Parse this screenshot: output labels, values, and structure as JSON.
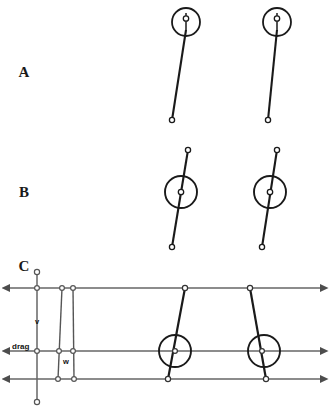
{
  "figure": {
    "title": "",
    "width": 329,
    "height": 420,
    "background": "#ffffff",
    "stroke_dark": "#1a1a1a",
    "stroke_grey": "#666666",
    "node_fill": "#ffffff"
  },
  "panels": [
    {
      "letter": "A",
      "letter_x": 24,
      "letter_y": 77,
      "description": "two tilted rods with circle at top end",
      "rods": [
        {
          "name": "rod-a-left",
          "top": {
            "x": 186,
            "y": 30
          },
          "bottom": {
            "x": 172,
            "y": 120
          },
          "circle": {
            "cx": 186,
            "cy": 22,
            "r": 14
          },
          "inner_node": {
            "cx": 186,
            "cy": 19,
            "r": 2.6
          },
          "inner_tick": {
            "x1": 186,
            "y1": 14,
            "x2": 186,
            "y2": 30
          }
        },
        {
          "name": "rod-a-right",
          "top": {
            "x": 277,
            "y": 30
          },
          "bottom": {
            "x": 268,
            "y": 120
          },
          "circle": {
            "cx": 277,
            "cy": 22,
            "r": 14
          },
          "inner_node": {
            "cx": 277,
            "cy": 19,
            "r": 2.6
          },
          "inner_tick": {
            "x1": 277,
            "y1": 14,
            "x2": 277,
            "y2": 30
          }
        }
      ]
    },
    {
      "letter": "B",
      "letter_x": 24,
      "letter_y": 197,
      "description": "two tilted rods with circle at midpoint",
      "rods": [
        {
          "name": "rod-b-left",
          "top": {
            "x": 188,
            "y": 150
          },
          "bottom": {
            "x": 172,
            "y": 247
          },
          "circle": {
            "cx": 181,
            "cy": 192,
            "r": 16
          },
          "inner_node": {
            "cx": 181,
            "cy": 192,
            "r": 2.6
          }
        },
        {
          "name": "rod-b-right",
          "top": {
            "x": 277,
            "y": 150
          },
          "bottom": {
            "x": 262,
            "y": 247
          },
          "circle": {
            "cx": 270,
            "cy": 192,
            "r": 16
          },
          "inner_node": {
            "cx": 270,
            "cy": 192,
            "r": 2.6
          }
        }
      ]
    },
    {
      "letter": "C",
      "letter_x": 24,
      "letter_y": 271,
      "description": "kinematic diagram with three horizontal double arrows, vertical v axis, drag label, narrow parallelogram of width w, and two tilted rods with circles",
      "labels": {
        "velocity": "v",
        "velocity_x": 37,
        "velocity_y": 324,
        "drag": "drag",
        "drag_x": 12,
        "drag_y": 349,
        "width": "w",
        "width_x": 66,
        "width_y": 363
      },
      "arrows": [
        {
          "name": "arrow-top",
          "y": 288,
          "x1": 10,
          "x2": 320
        },
        {
          "name": "arrow-middle",
          "y": 351,
          "x1": 10,
          "x2": 320
        },
        {
          "name": "arrow-bottom",
          "y": 379,
          "x1": 10,
          "x2": 320
        }
      ],
      "vertical_axis": {
        "x": 37,
        "y1": 272,
        "y2": 402
      },
      "parallelogram": {
        "top_left": {
          "x": 62,
          "y": 288
        },
        "top_right": {
          "x": 73,
          "y": 288
        },
        "mid_left": {
          "x": 58,
          "y": 351
        },
        "mid_right": {
          "x": 74,
          "y": 351
        },
        "bottom_left": {
          "x": 58,
          "y": 379
        },
        "bottom_right": {
          "x": 74,
          "y": 379
        }
      },
      "rods": [
        {
          "name": "rod-c-left",
          "top": {
            "x": 185,
            "y": 288
          },
          "bottom": {
            "x": 168,
            "y": 379
          },
          "circle": {
            "cx": 175,
            "cy": 351,
            "r": 16
          },
          "inner_node": {
            "cx": 175,
            "cy": 351,
            "r": 2.4
          }
        },
        {
          "name": "rod-c-right",
          "top": {
            "x": 250,
            "y": 288
          },
          "bottom": {
            "x": 266,
            "y": 379
          },
          "circle": {
            "cx": 264,
            "cy": 351,
            "r": 16
          },
          "inner_node": {
            "cx": 264,
            "cy": 351,
            "r": 2.4
          }
        }
      ]
    }
  ]
}
